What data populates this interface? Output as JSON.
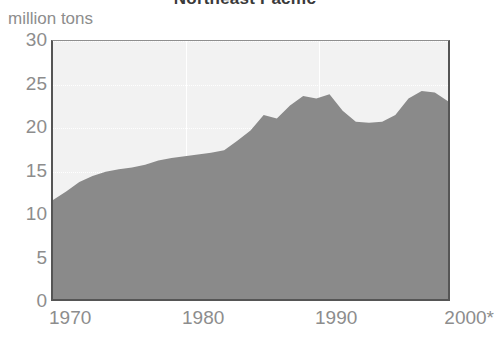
{
  "chart_data": {
    "type": "area",
    "title": "Northeast Pacific",
    "subtitle": "",
    "ylabel": "million tons",
    "xlabel": "",
    "xlim": [
      1970,
      2000
    ],
    "ylim": [
      0,
      30
    ],
    "grid": true,
    "legend": null,
    "series_name": "Northeast Pacific catch",
    "fill_color": "#8a8a8a",
    "plot_background": "#f2f2f2",
    "axis_color": "#555555",
    "tick_label_color": "#8d8d8d",
    "y_ticks": [
      "0",
      "5",
      "10",
      "15",
      "20",
      "25",
      "30"
    ],
    "y_tick_values": [
      0,
      5,
      10,
      15,
      20,
      25,
      30
    ],
    "x_ticks": [
      "1970",
      "1980",
      "1990",
      "2000*"
    ],
    "x_tick_values": [
      1970,
      1980,
      1990,
      2000
    ],
    "x": [
      1970,
      1971,
      1972,
      1973,
      1974,
      1975,
      1976,
      1977,
      1978,
      1979,
      1980,
      1981,
      1982,
      1983,
      1984,
      1985,
      1986,
      1987,
      1988,
      1989,
      1990,
      1991,
      1992,
      1993,
      1994,
      1995,
      1996,
      1997,
      1998,
      1999,
      2000
    ],
    "values": [
      11.5,
      12.5,
      13.6,
      14.3,
      14.8,
      15.1,
      15.3,
      15.6,
      16.1,
      16.4,
      16.6,
      16.8,
      17.0,
      17.3,
      18.4,
      19.6,
      21.4,
      21.0,
      22.5,
      23.6,
      23.3,
      23.8,
      21.9,
      20.6,
      20.5,
      20.6,
      21.4,
      23.3,
      24.2,
      24.0,
      23.0
    ],
    "footnote": "* provisional"
  }
}
